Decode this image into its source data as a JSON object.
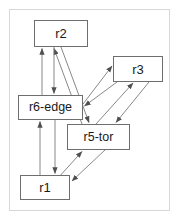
{
  "figure": {
    "kind": "directed-graph",
    "background_color": "#ffffff",
    "frame_border_color": "#d8d8d8",
    "node_border_color": "#6e6e6e",
    "node_fill_color": "#ffffff",
    "edge_color": "#5a5a5a",
    "label_color": "#1a1a1a"
  },
  "nodes": [
    {
      "id": "r2",
      "label": "r2"
    },
    {
      "id": "r3",
      "label": "r3"
    },
    {
      "id": "r6edge",
      "label": "r6-edge"
    },
    {
      "id": "r5tor",
      "label": "r5-tor"
    },
    {
      "id": "r1",
      "label": "r1"
    }
  ],
  "edges": [
    {
      "from": "r6edge",
      "to": "r2",
      "arrow": "to"
    },
    {
      "from": "r2",
      "to": "r6edge",
      "arrow": "to"
    },
    {
      "from": "r5tor",
      "to": "r2",
      "arrow": "to"
    },
    {
      "from": "r2",
      "to": "r5tor",
      "arrow": "to"
    },
    {
      "from": "r6edge",
      "to": "r3",
      "arrow": "to"
    },
    {
      "from": "r3",
      "to": "r6edge",
      "arrow": "to"
    },
    {
      "from": "r5tor",
      "to": "r3",
      "arrow": "to"
    },
    {
      "from": "r3",
      "to": "r5tor",
      "arrow": "to"
    },
    {
      "from": "r6edge",
      "to": "r1",
      "arrow": "to"
    },
    {
      "from": "r1",
      "to": "r6edge",
      "arrow": "to"
    },
    {
      "from": "r1",
      "to": "r5tor",
      "arrow": "to"
    },
    {
      "from": "r5tor",
      "to": "r1",
      "arrow": "to"
    }
  ]
}
